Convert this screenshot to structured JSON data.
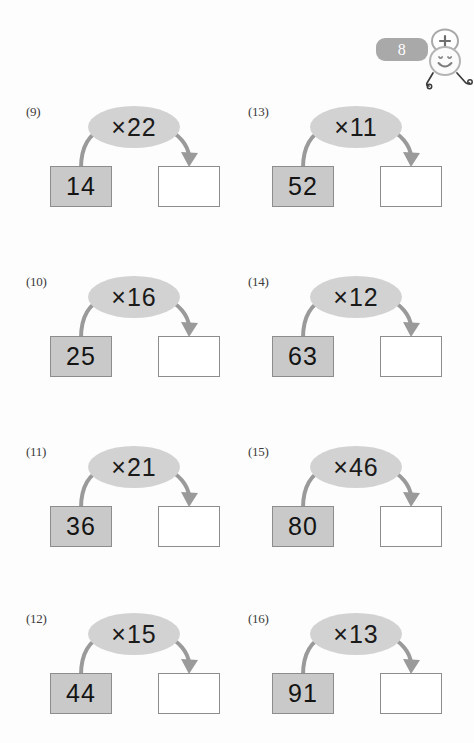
{
  "page": {
    "background_color": "#fdfdfd",
    "bubble_color": "#d2d2d2",
    "input_box_color": "#c9c9c9",
    "border_color": "#8d8d8d",
    "arrow_color": "#9a9a9a"
  },
  "decoration": {
    "badge_value": "8",
    "badge_color": "#a9a9a9",
    "plus_sign": "+",
    "mascot_icon": "smiley-face-character"
  },
  "problems": [
    {
      "label": "(9)",
      "operation": "×22",
      "multiplier": 22,
      "input": "14",
      "output": "",
      "column": "left",
      "row": 1
    },
    {
      "label": "(10)",
      "operation": "×16",
      "multiplier": 16,
      "input": "25",
      "output": "",
      "column": "left",
      "row": 2
    },
    {
      "label": "(11)",
      "operation": "×21",
      "multiplier": 21,
      "input": "36",
      "output": "",
      "column": "left",
      "row": 3
    },
    {
      "label": "(12)",
      "operation": "×15",
      "multiplier": 15,
      "input": "44",
      "output": "",
      "column": "left",
      "row": 4
    },
    {
      "label": "(13)",
      "operation": "×11",
      "multiplier": 11,
      "input": "52",
      "output": "",
      "column": "right",
      "row": 1
    },
    {
      "label": "(14)",
      "operation": "×12",
      "multiplier": 12,
      "input": "63",
      "output": "",
      "column": "right",
      "row": 2
    },
    {
      "label": "(15)",
      "operation": "×46",
      "multiplier": 46,
      "input": "80",
      "output": "",
      "column": "right",
      "row": 3
    },
    {
      "label": "(16)",
      "operation": "×13",
      "multiplier": 13,
      "input": "91",
      "output": "",
      "column": "right",
      "row": 4
    }
  ]
}
